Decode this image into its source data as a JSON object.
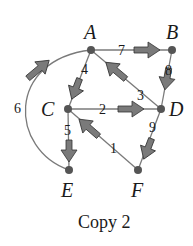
{
  "diagram": {
    "type": "directed-weighted-graph",
    "nodes": [
      {
        "id": "A",
        "label": "A",
        "x": 91,
        "y": 50
      },
      {
        "id": "B",
        "label": "B",
        "x": 172,
        "y": 50
      },
      {
        "id": "C",
        "label": "C",
        "x": 68,
        "y": 109
      },
      {
        "id": "D",
        "label": "D",
        "x": 161,
        "y": 109
      },
      {
        "id": "E",
        "label": "E",
        "x": 69,
        "y": 170
      },
      {
        "id": "F",
        "label": "F",
        "x": 138,
        "y": 170
      }
    ],
    "edges": [
      {
        "from": "A",
        "to": "B",
        "weight": "7"
      },
      {
        "from": "B",
        "to": "D",
        "weight": "8"
      },
      {
        "from": "D",
        "to": "A",
        "weight": "3"
      },
      {
        "from": "A",
        "to": "C",
        "weight": "4"
      },
      {
        "from": "C",
        "to": "D",
        "weight": "2"
      },
      {
        "from": "D",
        "to": "F",
        "weight": "9"
      },
      {
        "from": "F",
        "to": "C",
        "weight": "1"
      },
      {
        "from": "C",
        "to": "E",
        "weight": "5"
      },
      {
        "from": "E",
        "to": "A",
        "weight": "6",
        "curved": true
      }
    ],
    "caption": "Copy 2",
    "colors": {
      "edge": "#7a7a7a",
      "node": "#555555",
      "text": "#1a1a1a"
    }
  }
}
